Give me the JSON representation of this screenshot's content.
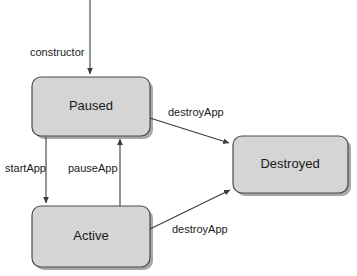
{
  "diagram": {
    "type": "state-diagram",
    "colors": {
      "state_fill": "#d5d5d5",
      "state_stroke": "#4a4a4a",
      "state_shadow": "#a8a8a8",
      "edge_stroke": "#3b3b3b",
      "text": "#1a1a1a",
      "background": "#ffffff"
    },
    "states": [
      {
        "id": "paused",
        "label": "Paused",
        "x": 32,
        "y": 77,
        "width": 118,
        "height": 59,
        "radius": 9
      },
      {
        "id": "active",
        "label": "Active",
        "x": 32,
        "y": 206,
        "width": 118,
        "height": 61,
        "radius": 9
      },
      {
        "id": "destroyed",
        "label": "Destroyed",
        "x": 233,
        "y": 136,
        "width": 115,
        "height": 57,
        "radius": 9
      }
    ],
    "transitions": [
      {
        "id": "constructor",
        "label": "constructor",
        "from": "start",
        "to": "paused",
        "label_x": 30,
        "label_y": 53,
        "path": "M 90 0 L 90 75"
      },
      {
        "id": "start-app",
        "label": "startApp",
        "from": "paused",
        "to": "active",
        "label_x": 5,
        "label_y": 169,
        "path": "M 46 137 L 46 204"
      },
      {
        "id": "pause-app",
        "label": "pauseApp",
        "from": "active",
        "to": "paused",
        "label_x": 68,
        "label_y": 169,
        "path": "M 120 206 L 120 138"
      },
      {
        "id": "destroy-app-from-paused",
        "label": "destroyApp",
        "from": "paused",
        "to": "destroyed",
        "label_x": 168,
        "label_y": 113,
        "path": "M 150 118 L 231 144"
      },
      {
        "id": "destroy-app-from-active",
        "label": "destroyApp",
        "from": "active",
        "to": "destroyed",
        "label_x": 172,
        "label_y": 230,
        "path": "M 150 229 L 231 188"
      }
    ]
  }
}
